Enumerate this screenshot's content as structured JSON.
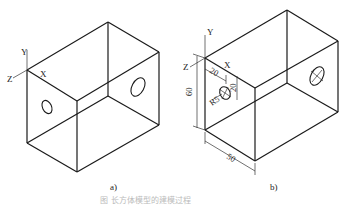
{
  "figure": {
    "caption": "图 长方体模型的建模过程",
    "panels": [
      {
        "id": "a",
        "label": "a)",
        "axes": {
          "x": "X",
          "y": "Y",
          "z": "Z"
        }
      },
      {
        "id": "b",
        "label": "b)",
        "axes": {
          "x": "X",
          "y": "Y",
          "z": "Z"
        },
        "dimensions": {
          "height": "60",
          "depth": "50",
          "hole_offset_x": "20",
          "hole_offset_y": "20",
          "hole_radius": "R5"
        }
      }
    ]
  }
}
